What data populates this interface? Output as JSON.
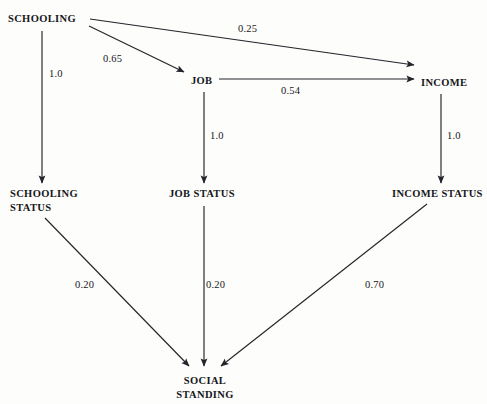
{
  "diagram": {
    "type": "path-diagram",
    "background_color": "#fdfdfc",
    "line_color": "#24242a",
    "text_color": "#16161a",
    "nodes": [
      {
        "id": "schooling",
        "label": "SCHOOLING",
        "x": 8,
        "y": 22,
        "align": "start"
      },
      {
        "id": "job",
        "label": "JOB",
        "x": 191,
        "y": 84,
        "align": "start"
      },
      {
        "id": "income",
        "label": "INCOME",
        "x": 421,
        "y": 86,
        "align": "start"
      },
      {
        "id": "schooling-status",
        "label_line1": "SCHOOLING",
        "label_line2": "STATUS",
        "x": 10,
        "y": 197,
        "align": "start"
      },
      {
        "id": "job-status",
        "label": "JOB STATUS",
        "x": 169,
        "y": 197,
        "align": "start"
      },
      {
        "id": "income-status",
        "label": "INCOME STATUS",
        "x": 392,
        "y": 197,
        "align": "start"
      },
      {
        "id": "social-standing",
        "label_line1": "SOCIAL",
        "label_line2": "STANDING",
        "x": 205,
        "y": 384,
        "align": "middle"
      }
    ],
    "edges": [
      {
        "id": "schooling-to-income",
        "from": "schooling",
        "to": "income",
        "coefficient": "0.25",
        "label_x": 238,
        "label_y": 32
      },
      {
        "id": "schooling-to-job",
        "from": "schooling",
        "to": "job",
        "coefficient": "0.65",
        "label_x": 103,
        "label_y": 62
      },
      {
        "id": "job-to-income",
        "from": "job",
        "to": "income",
        "coefficient": "0.54",
        "label_x": 281,
        "label_y": 94
      },
      {
        "id": "schooling-to-schooling-status",
        "from": "schooling",
        "to": "schooling-status",
        "coefficient": "1.0",
        "label_x": 49,
        "label_y": 77
      },
      {
        "id": "job-to-job-status",
        "from": "job",
        "to": "job-status",
        "coefficient": "1.0",
        "label_x": 210,
        "label_y": 139
      },
      {
        "id": "income-to-income-status",
        "from": "income",
        "to": "income-status",
        "coefficient": "1.0",
        "label_x": 447,
        "label_y": 139
      },
      {
        "id": "schooling-status-to-social",
        "from": "schooling-status",
        "to": "social-standing",
        "coefficient": "0.20",
        "label_x": 75,
        "label_y": 288
      },
      {
        "id": "job-status-to-social",
        "from": "job-status",
        "to": "social-standing",
        "coefficient": "0.20",
        "label_x": 206,
        "label_y": 288
      },
      {
        "id": "income-status-to-social",
        "from": "income-status",
        "to": "social-standing",
        "coefficient": "0.70",
        "label_x": 365,
        "label_y": 288
      }
    ]
  }
}
